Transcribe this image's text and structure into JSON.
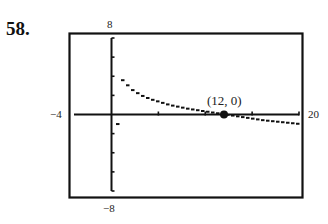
{
  "problem": {
    "number": "58."
  },
  "chart_data": {
    "type": "line",
    "title": "",
    "xlabel": "",
    "ylabel": "",
    "xlim": [
      -4,
      20
    ],
    "ylim": [
      -8,
      8
    ],
    "grid": false,
    "window_labels": {
      "xmin": "−4",
      "xmax": "20",
      "ymin": "−8",
      "ymax": "8"
    },
    "x_ticks": [
      5,
      10,
      15,
      20
    ],
    "y_ticks": [
      -8,
      -6,
      -4,
      -2,
      2,
      4,
      6,
      8
    ],
    "series": [
      {
        "name": "curve",
        "style": "dashed-calculator",
        "x": [
          0.5,
          1,
          2,
          3,
          4,
          6,
          8,
          10,
          12,
          14,
          16,
          18,
          20
        ],
        "y": [
          4.6,
          3.6,
          2.6,
          2.0,
          1.6,
          1.0,
          0.6,
          0.3,
          0.0,
          -0.3,
          -0.6,
          -0.8,
          -1.0
        ]
      }
    ],
    "points": [
      {
        "x": 12,
        "y": 0,
        "label": "(12, 0)"
      }
    ],
    "annotations": [
      "(12, 0)"
    ]
  },
  "colors": {
    "ink": "#111111",
    "background": "#ffffff"
  }
}
